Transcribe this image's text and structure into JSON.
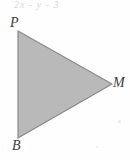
{
  "figure": {
    "name": "triangle-PBM",
    "background_color": "#fefefe",
    "fill_color": "#b9b9b9",
    "stroke_color": "#8a8a8a",
    "label_color": "#3a3a3a",
    "cut_off_text": "2x - y - 3",
    "shape": {
      "type": "triangle",
      "points": "18,31 112,84 18,138",
      "vertices": [
        {
          "id": "P",
          "label": "P",
          "x": 18,
          "y": 31
        },
        {
          "id": "M",
          "label": "M",
          "x": 112,
          "y": 84
        },
        {
          "id": "B",
          "label": "B",
          "x": 18,
          "y": 138
        }
      ]
    }
  }
}
